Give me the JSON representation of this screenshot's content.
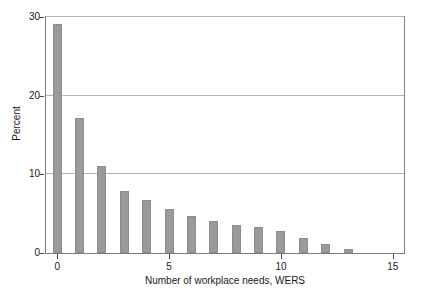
{
  "chart_data": {
    "type": "bar",
    "title": "",
    "subtitle": "",
    "xlabel": "Number of workplace needs, WERS",
    "ylabel": "Percent",
    "categories": [
      0,
      1,
      2,
      3,
      4,
      5,
      6,
      7,
      8,
      9,
      10,
      11,
      12,
      13
    ],
    "values": [
      29.1,
      17.2,
      11.1,
      7.9,
      6.8,
      5.6,
      4.7,
      4.1,
      3.6,
      3.3,
      2.8,
      1.9,
      1.2,
      0.5
    ],
    "series": [
      {
        "name": "Percent of workplaces",
        "values": [
          29.1,
          17.2,
          11.1,
          7.9,
          6.8,
          5.6,
          4.7,
          4.1,
          3.6,
          3.3,
          2.8,
          1.9,
          1.2,
          0.5
        ]
      }
    ],
    "xlim": [
      -0.5,
      15.5
    ],
    "ylim": [
      0,
      30
    ],
    "x_ticks": [
      0,
      5,
      10,
      15
    ],
    "x_tick_labels": [
      "0",
      "5",
      "10",
      "15"
    ],
    "y_ticks": [
      0,
      10,
      20,
      30
    ],
    "y_tick_labels": [
      "0",
      "10",
      "20",
      "30"
    ],
    "grid": "horizontal",
    "legend": "none",
    "bar_color": "#9a9a9a",
    "grid_color": "#b5b5b5",
    "frame_color": "#7d7d7d",
    "background": "#ffffff",
    "annotations": []
  }
}
